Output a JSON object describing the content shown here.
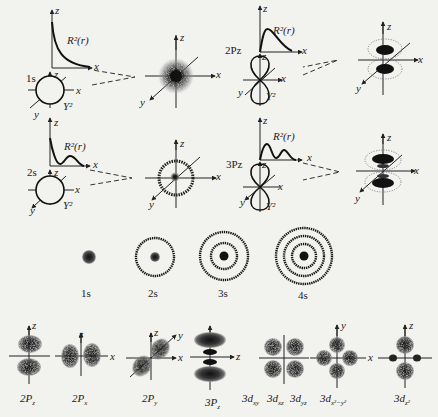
{
  "diagram": {
    "top_rows": [
      {
        "name": "1s",
        "label": "1s",
        "radial_label": "R²(r)",
        "angular_label": "Y²",
        "axes": {
          "z": "z",
          "x": "x",
          "y": "y"
        }
      },
      {
        "name": "2Pz",
        "label": "2Pz",
        "radial_label": "R²(r)",
        "angular_label": "Y²",
        "axes": {
          "z": "z",
          "x": "x",
          "y": "y"
        }
      },
      {
        "name": "2s",
        "label": "2s",
        "radial_label": "R²(r)",
        "angular_label": "Y²",
        "axes": {
          "z": "z",
          "x": "x",
          "y": "y"
        }
      },
      {
        "name": "3Pz",
        "label": "3Pz",
        "radial_label": "R²(r)",
        "angular_label": "Y²",
        "axes": {
          "z": "z",
          "x": "x",
          "y": "y"
        }
      }
    ],
    "s_series": [
      "1s",
      "2s",
      "3s",
      "4s"
    ],
    "bottom_row": [
      {
        "main": "2P",
        "sub": "z"
      },
      {
        "main": "2P",
        "sub": "x"
      },
      {
        "main": "2P",
        "sub": "y"
      },
      {
        "main": "3P",
        "sub": "z"
      },
      {
        "main": "3d",
        "sub": "xy"
      },
      {
        "main": "3d",
        "sub": "xz"
      },
      {
        "main": "3d",
        "sub": "yz"
      },
      {
        "main": "3d",
        "sub": "x²−y²"
      },
      {
        "main": "3d",
        "sub": "z²"
      }
    ],
    "axis_labels": {
      "x": "x",
      "y": "y",
      "z": "z"
    },
    "colors": {
      "background": "#f2f2ef",
      "ink": "#222222",
      "cloud": "#1a1a1a"
    }
  }
}
